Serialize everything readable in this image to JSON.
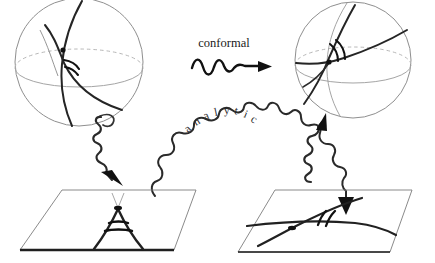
{
  "figure": {
    "title_labels": {
      "conformal": "conformal",
      "analytic": "analytic"
    },
    "background_color": "#ffffff",
    "ink_color": "#1a1a1a",
    "light_ink_color": "#9a9a9a"
  },
  "arc_word_letters": [
    "a",
    "n",
    "a",
    "l",
    "y",
    "t",
    "i",
    "c"
  ],
  "panels": [
    {
      "id": "sphere-left",
      "kind": "sphere",
      "position": "top-left",
      "has_equator": true,
      "has_intersection_dot": true,
      "angle_arc_count": 2,
      "geodesic_count": 2
    },
    {
      "id": "sphere-right",
      "kind": "sphere",
      "position": "top-right",
      "has_equator": true,
      "has_intersection_dot": true,
      "angle_arc_count": 2,
      "geodesic_count": 2
    },
    {
      "id": "plane-left",
      "kind": "plane",
      "position": "bottom-left",
      "has_intersection_dot": true,
      "angle_arc_count": 2,
      "curve_count": 2,
      "feature": "cusp"
    },
    {
      "id": "plane-right",
      "kind": "plane",
      "position": "bottom-right",
      "has_intersection_dot": true,
      "angle_arc_count": 2,
      "curve_count": 2,
      "feature": "transversal-crossing"
    }
  ],
  "arrows": [
    {
      "id": "conformal-arrow",
      "style": "wavy",
      "direction": "right",
      "label": "conformal",
      "from": "sphere-left",
      "to": "sphere-right"
    },
    {
      "id": "analytic-arrow",
      "style": "wavy-arched",
      "direction": "right-down",
      "label": "analytic",
      "from": "plane-left",
      "to": "plane-right"
    },
    {
      "id": "projection-arrow-left",
      "style": "wavy",
      "direction": "down",
      "label": "",
      "from": "sphere-left",
      "to": "plane-left"
    },
    {
      "id": "projection-arrow-right",
      "style": "wavy",
      "direction": "up",
      "label": "",
      "from": "plane-right",
      "to": "sphere-right"
    }
  ]
}
